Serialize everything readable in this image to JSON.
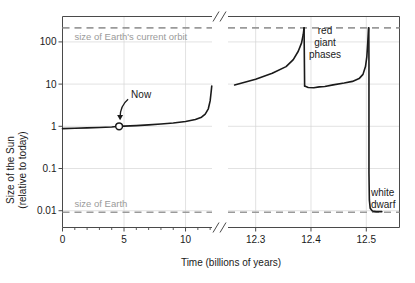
{
  "chart_data": {
    "type": "line",
    "title": "",
    "xlabel": "Time (billions of years)",
    "ylabel_line1": "Size of the Sun",
    "ylabel_line2": "(relative to today)",
    "y_scale": "log",
    "ylim": [
      0.004,
      400
    ],
    "y_ticks": [
      {
        "value": 100,
        "label": "100"
      },
      {
        "value": 10,
        "label": "10"
      },
      {
        "value": 1,
        "label": "1"
      },
      {
        "value": 0.1,
        "label": "0.1"
      },
      {
        "value": 0.01,
        "label": "0.01"
      }
    ],
    "x_axis_broken": true,
    "x_segment_left": {
      "range": [
        0,
        12.15
      ],
      "ticks": [
        {
          "value": 0,
          "label": "0"
        },
        {
          "value": 5,
          "label": "5"
        },
        {
          "value": 10,
          "label": "10"
        }
      ],
      "minor_tick_step": 1
    },
    "x_segment_right": {
      "range": [
        12.25,
        12.56
      ],
      "ticks": [
        {
          "value": 12.3,
          "label": "12.3"
        },
        {
          "value": 12.4,
          "label": "12.4"
        },
        {
          "value": 12.5,
          "label": "12.5"
        }
      ]
    },
    "reference_lines": [
      {
        "name": "earth-orbit",
        "label": "size of Earth's current orbit",
        "value": 215,
        "style": "dashed",
        "color": "#9a9a9a"
      },
      {
        "name": "earth-size",
        "label": "size of Earth",
        "value": 0.0092,
        "style": "dashed",
        "color": "#9a9a9a"
      }
    ],
    "annotations": [
      {
        "name": "now-marker",
        "label": "Now",
        "x": 4.6,
        "y": 1.0,
        "marker": "open-circle"
      },
      {
        "name": "red-giant-label",
        "label_lines": [
          "red",
          "giant",
          "phases"
        ]
      },
      {
        "name": "white-dwarf-label",
        "label_lines": [
          "white",
          "dwarf"
        ]
      }
    ],
    "series": [
      {
        "name": "sun-size-main-sequence",
        "segment": "left",
        "points": [
          [
            0.0,
            0.88
          ],
          [
            1.0,
            0.9
          ],
          [
            2.0,
            0.92
          ],
          [
            3.0,
            0.94
          ],
          [
            4.0,
            0.96
          ],
          [
            4.6,
            1.0
          ],
          [
            5.0,
            1.01
          ],
          [
            6.0,
            1.04
          ],
          [
            7.0,
            1.08
          ],
          [
            8.0,
            1.13
          ],
          [
            9.0,
            1.2
          ],
          [
            10.0,
            1.3
          ],
          [
            10.8,
            1.45
          ],
          [
            11.3,
            1.65
          ],
          [
            11.6,
            1.95
          ],
          [
            11.85,
            2.6
          ],
          [
            12.0,
            4.0
          ],
          [
            12.08,
            6.5
          ],
          [
            12.13,
            9.0
          ]
        ]
      },
      {
        "name": "sun-size-red-giant-phase-1",
        "segment": "right",
        "points": [
          [
            12.262,
            9.5
          ],
          [
            12.3,
            13
          ],
          [
            12.33,
            18
          ],
          [
            12.355,
            26
          ],
          [
            12.368,
            38
          ],
          [
            12.377,
            60
          ],
          [
            12.383,
            95
          ],
          [
            12.386,
            150
          ],
          [
            12.3875,
            215
          ]
        ]
      },
      {
        "name": "sun-size-helium-flash-drop",
        "segment": "right",
        "points": [
          [
            12.3875,
            215
          ],
          [
            12.3885,
            9.0
          ]
        ]
      },
      {
        "name": "sun-size-horizontal-branch",
        "segment": "right",
        "points": [
          [
            12.3885,
            9.0
          ],
          [
            12.395,
            8.3
          ],
          [
            12.405,
            8.2
          ],
          [
            12.415,
            8.6
          ],
          [
            12.425,
            8.8
          ],
          [
            12.44,
            9.6
          ],
          [
            12.46,
            10.6
          ],
          [
            12.475,
            11.6
          ],
          [
            12.487,
            13.5
          ],
          [
            12.494,
            17
          ],
          [
            12.4985,
            26
          ],
          [
            12.501,
            45
          ],
          [
            12.5025,
            90
          ],
          [
            12.5035,
            160
          ],
          [
            12.504,
            215
          ]
        ]
      },
      {
        "name": "sun-size-white-dwarf-collapse",
        "segment": "right",
        "points": [
          [
            12.5045,
            215
          ],
          [
            12.5048,
            30
          ],
          [
            12.5048,
            1.0
          ],
          [
            12.5048,
            0.08
          ],
          [
            12.5055,
            0.018
          ],
          [
            12.507,
            0.0115
          ],
          [
            12.511,
            0.0098
          ],
          [
            12.518,
            0.0095
          ],
          [
            12.528,
            0.0095
          ]
        ]
      }
    ]
  }
}
